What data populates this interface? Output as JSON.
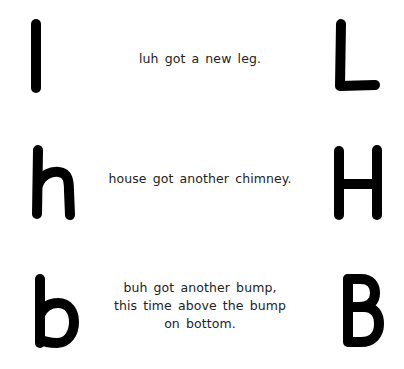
{
  "rows": [
    {
      "lowercase": {
        "letter": "l",
        "icon": "letter-l-lowercase"
      },
      "caption_lines": [
        "luh got a new leg."
      ],
      "uppercase": {
        "letter": "L",
        "icon": "letter-l-uppercase"
      }
    },
    {
      "lowercase": {
        "letter": "h",
        "icon": "letter-h-lowercase"
      },
      "caption_lines": [
        "house got another chimney."
      ],
      "uppercase": {
        "letter": "H",
        "icon": "letter-h-uppercase"
      }
    },
    {
      "lowercase": {
        "letter": "b",
        "icon": "letter-b-lowercase"
      },
      "caption_lines": [
        "buh got another bump,",
        "this time above the bump",
        "on bottom."
      ],
      "uppercase": {
        "letter": "B",
        "icon": "letter-b-uppercase"
      }
    }
  ],
  "colors": {
    "background": "#ffffff",
    "glyph_stroke": "#000000",
    "caption_text": "#222222"
  }
}
